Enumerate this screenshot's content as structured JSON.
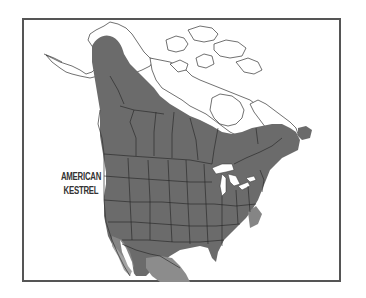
{
  "map": {
    "title_line1": "AMERICAN",
    "title_line2": "KESTREL",
    "species": "American Kestrel",
    "region": "North America",
    "legend": [
      {
        "name": "year-round range",
        "color": "#6b6b6b"
      },
      {
        "name": "winter range",
        "color": "#8a8a8a"
      },
      {
        "name": "outside range",
        "color": "#ffffff"
      }
    ],
    "colors": {
      "frame": "#555555",
      "range_dark": "#6b6b6b",
      "range_light": "#8c8c8c",
      "borders": "#222222",
      "water": "#ffffff"
    }
  }
}
